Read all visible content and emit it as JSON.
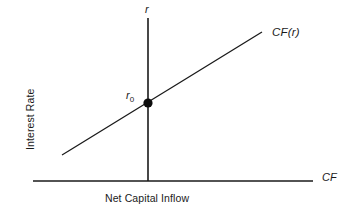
{
  "figure": {
    "background_color": "#ffffff",
    "stroke_color": "#1a1a1a",
    "y_axis_variable": "r",
    "x_axis_variable": "CF",
    "y_axis_title": "Interest Rate",
    "x_axis_title": "Net Capital Inflow",
    "curve_label": "CF(r)",
    "point_label_base": "r",
    "point_label_sub": "0"
  },
  "chart_data": {
    "type": "line",
    "title": "",
    "xlabel": "Net Capital Inflow",
    "ylabel": "Interest Rate",
    "x_axis_variable": "CF",
    "y_axis_variable": "r",
    "grid": false,
    "legend": false,
    "series": [
      {
        "name": "CF(r)",
        "label": "CF(r)",
        "description": "Upward sloping net capital inflow schedule as a function of the interest rate",
        "x": [
          -86,
          114
        ],
        "y": [
          -52,
          71
        ],
        "points_px": [
          [
            62,
            155
          ],
          [
            262,
            32
          ]
        ]
      }
    ],
    "annotations": [
      {
        "name": "equilibrium-point",
        "label": "r0",
        "x": 0,
        "y": 0,
        "point_px": [
          148,
          103
        ],
        "marker": "filled-circle"
      }
    ],
    "axes": {
      "x_axis_px": {
        "y": 181,
        "x_start": 33,
        "x_end": 313
      },
      "y_axis_px": {
        "x": 148,
        "y_start": 18,
        "y_end": 181
      },
      "origin_px": [
        148,
        181
      ]
    }
  }
}
